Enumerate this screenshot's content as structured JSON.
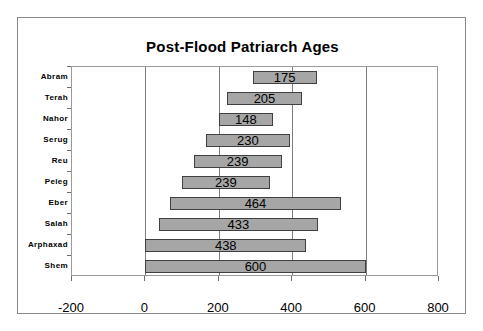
{
  "chart_data": {
    "type": "bar",
    "orientation": "horizontal",
    "subtype": "floating-range-bar",
    "title": "Post-Flood Patriarch Ages",
    "xlabel": "",
    "ylabel": "",
    "xlim": [
      -200,
      800
    ],
    "xticks": [
      -200,
      0,
      200,
      400,
      600,
      800
    ],
    "xtick_labels": [
      "-200",
      "0",
      "200",
      "400",
      "600",
      "800"
    ],
    "grid": true,
    "gridlines_at": [
      0,
      200,
      400,
      600
    ],
    "legend": false,
    "categories": [
      "Abram",
      "Terah",
      "Nahor",
      "Serug",
      "Reu",
      "Peleg",
      "Eber",
      "Salah",
      "Arphaxad",
      "Shem"
    ],
    "values": [
      175,
      205,
      148,
      230,
      239,
      239,
      464,
      433,
      438,
      600
    ],
    "bars": [
      {
        "category": "Abram",
        "start": 292,
        "end": 467,
        "value": 175,
        "label": "175"
      },
      {
        "category": "Terah",
        "start": 222,
        "end": 427,
        "value": 205,
        "label": "205"
      },
      {
        "category": "Nahor",
        "start": 200,
        "end": 348,
        "value": 148,
        "label": "148"
      },
      {
        "category": "Serug",
        "start": 164,
        "end": 394,
        "value": 230,
        "label": "230"
      },
      {
        "category": "Reu",
        "start": 132,
        "end": 371,
        "value": 239,
        "label": "239"
      },
      {
        "category": "Peleg",
        "start": 100,
        "end": 339,
        "value": 239,
        "label": "239"
      },
      {
        "category": "Eber",
        "start": 68,
        "end": 532,
        "value": 464,
        "label": "464"
      },
      {
        "category": "Salah",
        "start": 37,
        "end": 470,
        "value": 433,
        "label": "433"
      },
      {
        "category": "Arphaxad",
        "start": 0,
        "end": 438,
        "value": 438,
        "label": "438"
      },
      {
        "category": "Shem",
        "start": 0,
        "end": 600,
        "value": 600,
        "label": "600"
      }
    ],
    "bar_fill_color": "#a6a6a6",
    "bar_border_color": "#404040",
    "plot_border_color": "#9a9a9a",
    "gridline_color": "#7d7d7d",
    "frame_border_color": "#888888",
    "text_color": "#000000"
  }
}
